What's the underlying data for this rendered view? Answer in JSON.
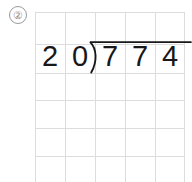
{
  "worksheet": {
    "problem_number": "②",
    "grid": {
      "columns": 5,
      "rows": 6,
      "cell_width": 30,
      "cell_height": 28,
      "line_color": "#dcdcdc",
      "vertical_line_x": [
        0,
        30,
        60,
        90,
        120,
        150
      ],
      "horizontal_line_y": [
        0,
        32,
        61,
        88,
        116,
        144,
        170
      ]
    },
    "problem": {
      "type": "long-division",
      "divisor": "20",
      "dividend": "774",
      "quotient": "",
      "digits": [
        "2",
        "0",
        "7",
        "7",
        "4"
      ],
      "bracket_symbol": ")",
      "text_color": "#18181a",
      "bracket_color": "#18181a"
    }
  }
}
